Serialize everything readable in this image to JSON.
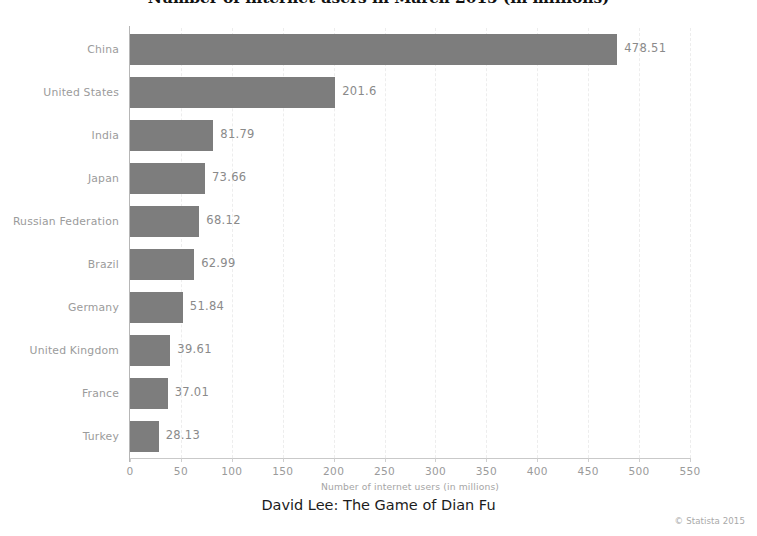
{
  "chart_data": {
    "type": "bar",
    "orientation": "horizontal",
    "title": "Number of internet users in March 2015 (in millions)",
    "xlabel": "Number of internet users (in millions)",
    "ylabel": "",
    "xlim": [
      0,
      550
    ],
    "xticks": [
      0,
      50,
      100,
      150,
      200,
      250,
      300,
      350,
      400,
      450,
      500,
      550
    ],
    "grid": "vertical-dashed",
    "legend": null,
    "bar_color": "#7d7d7d",
    "categories": [
      "China",
      "United States",
      "India",
      "Japan",
      "Russian Federation",
      "Brazil",
      "Germany",
      "United Kingdom",
      "France",
      "Turkey"
    ],
    "values": [
      478.51,
      201.6,
      81.79,
      73.66,
      68.12,
      62.99,
      51.84,
      39.61,
      37.01,
      28.13
    ],
    "value_labels": [
      "478.51",
      "201.6",
      "81.79",
      "73.66",
      "68.12",
      "62.99",
      "51.84",
      "39.61",
      "37.01",
      "28.13"
    ]
  },
  "footer": {
    "caption": "David Lee: The Game of Dian Fu",
    "copyright": "© Statista 2015"
  }
}
